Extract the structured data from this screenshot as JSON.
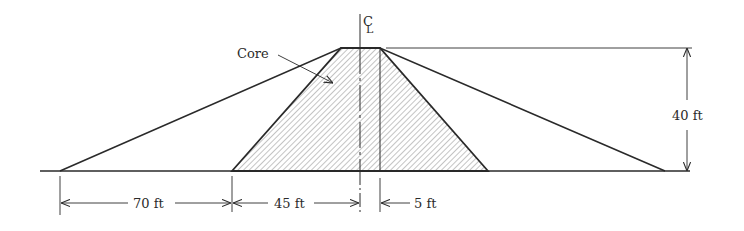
{
  "diagram": {
    "type": "dam-cross-section",
    "centerline_label": "CL",
    "core_label": "Core",
    "dimensions": {
      "height": "40 ft",
      "upstream_shell_base": "70 ft",
      "core_half_base": "45 ft",
      "crest_offset": "5 ft"
    },
    "colors": {
      "line": "#2a2a2a",
      "hatch": "#8a8a8a"
    }
  }
}
